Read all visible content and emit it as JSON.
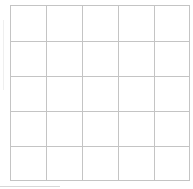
{
  "grid": {
    "rows": 5,
    "columns": 5,
    "line_color": "#c4c4c4",
    "background": "#ffffff"
  }
}
